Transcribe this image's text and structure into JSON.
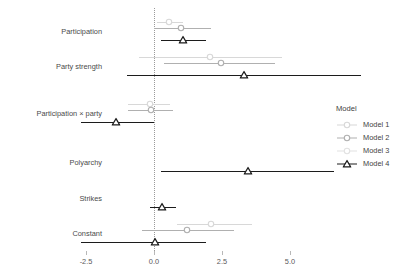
{
  "chart_data": {
    "type": "scatter",
    "subtype": "coefficient-forest-plot",
    "title": "",
    "xlabel": "",
    "ylabel": "",
    "xlim": [
      -3.2,
      6.2
    ],
    "xticks": [
      -2.5,
      0.0,
      2.5,
      5.0
    ],
    "xtick_labels": [
      "-2.5",
      "0.0",
      "2.5",
      "5.0"
    ],
    "grid": false,
    "reference_line": 0.0,
    "reference_line_style": "dotted",
    "legend": {
      "title": "Model",
      "position": "right",
      "entries": [
        {
          "name": "Model 1",
          "color": "#d8d8d8",
          "marker": "circle-open"
        },
        {
          "name": "Model 2",
          "color": "#b0b0b0",
          "marker": "circle-open"
        },
        {
          "name": "Model 3",
          "color": "#e2e2e2",
          "marker": "circle-open"
        },
        {
          "name": "Model 4",
          "color": "#1c1c1c",
          "marker": "triangle-open"
        }
      ]
    },
    "categories": [
      "Participation",
      "Party strength",
      "Participation × party",
      "Polyarchy",
      "Strikes",
      "Constant"
    ],
    "series": [
      {
        "name": "Model 1",
        "color": "#d8d8d8",
        "marker": "circle-open",
        "points": [
          {
            "category": "Participation",
            "estimate": 0.55,
            "low": 0.1,
            "high": 1.05
          },
          {
            "category": "Party strength",
            "estimate": 2.05,
            "low": -0.55,
            "high": 4.7
          },
          {
            "category": "Participation × party",
            "estimate": -0.15,
            "low": -0.95,
            "high": 0.6
          },
          {
            "category": "Polyarchy",
            "estimate": null,
            "low": null,
            "high": null
          },
          {
            "category": "Strikes",
            "estimate": null,
            "low": null,
            "high": null
          },
          {
            "category": "Constant",
            "estimate": 2.1,
            "low": 0.85,
            "high": 3.6
          }
        ]
      },
      {
        "name": "Model 2",
        "color": "#b0b0b0",
        "marker": "circle-open",
        "points": [
          {
            "category": "Participation",
            "estimate": 1.0,
            "low": 0.0,
            "high": 2.1
          },
          {
            "category": "Party strength",
            "estimate": 2.45,
            "low": 0.35,
            "high": 4.45
          },
          {
            "category": "Participation × party",
            "estimate": -0.1,
            "low": -0.95,
            "high": 0.7
          },
          {
            "category": "Polyarchy",
            "estimate": null,
            "low": null,
            "high": null
          },
          {
            "category": "Strikes",
            "estimate": null,
            "low": null,
            "high": null
          },
          {
            "category": "Constant",
            "estimate": 1.2,
            "low": -0.45,
            "high": 2.95
          }
        ]
      },
      {
        "name": "Model 3",
        "color": "#e2e2e2",
        "marker": "circle-open",
        "points": [
          {
            "category": "Participation",
            "estimate": null,
            "low": null,
            "high": null
          },
          {
            "category": "Party strength",
            "estimate": null,
            "low": null,
            "high": null
          },
          {
            "category": "Participation × party",
            "estimate": null,
            "low": null,
            "high": null
          },
          {
            "category": "Polyarchy",
            "estimate": null,
            "low": null,
            "high": null
          },
          {
            "category": "Strikes",
            "estimate": null,
            "low": null,
            "high": null
          },
          {
            "category": "Constant",
            "estimate": null,
            "low": null,
            "high": null
          }
        ]
      },
      {
        "name": "Model 4",
        "color": "#1c1c1c",
        "marker": "triangle-open",
        "points": [
          {
            "category": "Participation",
            "estimate": 1.05,
            "low": 0.25,
            "high": 1.9
          },
          {
            "category": "Party strength",
            "estimate": 3.3,
            "low": -1.0,
            "high": 7.6
          },
          {
            "category": "Participation × party",
            "estimate": -1.4,
            "low": -2.7,
            "high": 0.0
          },
          {
            "category": "Polyarchy",
            "estimate": 3.45,
            "low": 0.25,
            "high": 6.6
          },
          {
            "category": "Strikes",
            "estimate": 0.3,
            "low": -0.15,
            "high": 0.8
          },
          {
            "category": "Constant",
            "estimate": 0.05,
            "low": -2.7,
            "high": 1.9
          }
        ]
      }
    ]
  }
}
